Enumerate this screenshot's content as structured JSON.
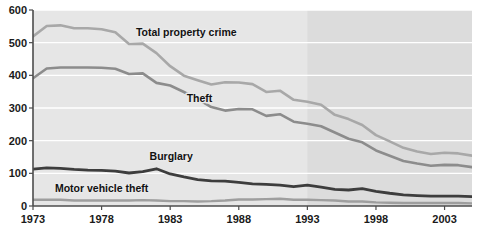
{
  "chart_data": {
    "type": "line",
    "title": "",
    "subtitle": "",
    "xlabel": "",
    "ylabel": "",
    "xlim": [
      1973,
      2005
    ],
    "ylim": [
      0,
      600
    ],
    "grid": true,
    "legend_position": "inline-annotations",
    "y_ticks": [
      "0",
      "100",
      "200",
      "300",
      "400",
      "500",
      "600"
    ],
    "y_tick_values": [
      0,
      100,
      200,
      300,
      400,
      500,
      600
    ],
    "x_ticks": [
      "1973",
      "1978",
      "1983",
      "1988",
      "1993",
      "1998",
      "2003"
    ],
    "x_tick_values": [
      1973,
      1978,
      1983,
      1988,
      1993,
      1998,
      2003
    ],
    "x": [
      1973,
      1974,
      1975,
      1976,
      1977,
      1978,
      1979,
      1980,
      1981,
      1982,
      1983,
      1984,
      1985,
      1986,
      1987,
      1988,
      1989,
      1990,
      1991,
      1992,
      1993,
      1994,
      1995,
      1996,
      1997,
      1998,
      1999,
      2000,
      2001,
      2002,
      2003,
      2004,
      2005
    ],
    "shaded_region": {
      "start": 1993,
      "end": 2005,
      "color": "#dcdcdc",
      "note": "redesigned survey period"
    },
    "plot_background": "#e6e6e6",
    "series": [
      {
        "name": "Total property crime",
        "color": "#a8a8a8",
        "label_x": 1980.5,
        "label_y": 520,
        "values": [
          519,
          551,
          553,
          544,
          544,
          541,
          532,
          496,
          497,
          468,
          428,
          399,
          385,
          372,
          379,
          378,
          373,
          349,
          353,
          325,
          319,
          310,
          279,
          266,
          248,
          217,
          198,
          178,
          167,
          159,
          163,
          161,
          154
        ]
      },
      {
        "name": "Theft",
        "color": "#8c8c8c",
        "label_x": 1984.2,
        "label_y": 318,
        "values": [
          391,
          421,
          424,
          424,
          424,
          423,
          420,
          404,
          406,
          377,
          369,
          349,
          327,
          303,
          292,
          297,
          296,
          276,
          281,
          258,
          252,
          244,
          225,
          206,
          195,
          170,
          154,
          138,
          130,
          123,
          126,
          125,
          119
        ]
      },
      {
        "name": "Burglary",
        "color": "#3d3d3d",
        "label_x": 1981.5,
        "label_y": 142,
        "values": [
          113,
          117,
          115,
          112,
          110,
          109,
          107,
          101,
          105,
          114,
          98,
          89,
          81,
          77,
          76,
          72,
          68,
          66,
          64,
          59,
          64,
          58,
          51,
          49,
          53,
          45,
          39,
          34,
          32,
          30,
          30,
          30,
          29
        ]
      },
      {
        "name": "Motor vehicle theft",
        "color": "#9e9e9e",
        "label_x": 1974.6,
        "label_y": 44,
        "values": [
          19,
          19,
          19,
          17,
          17,
          17,
          17,
          17,
          18,
          17,
          15,
          15,
          14,
          15,
          17,
          20,
          20,
          21,
          22,
          19,
          19,
          18,
          17,
          14,
          14,
          11,
          10,
          9,
          9,
          9,
          9,
          9,
          8
        ]
      }
    ]
  },
  "axis": {
    "y_axis_name": "rate per 1,000",
    "x_axis_name": "year"
  }
}
